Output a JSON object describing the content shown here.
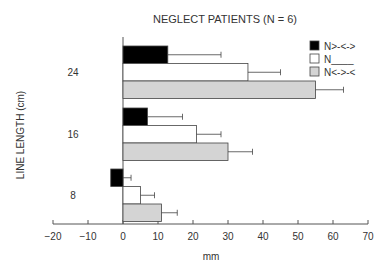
{
  "chart_data": {
    "type": "bar",
    "orientation": "horizontal",
    "title": "NEGLECT PATIENTS (N = 6)",
    "xlabel": "mm",
    "ylabel": "LINE LENGTH (cm)",
    "xlim": [
      -20,
      70
    ],
    "xticks": [
      -20,
      -10,
      0,
      10,
      20,
      30,
      40,
      50,
      60,
      70
    ],
    "categories": [
      "24",
      "16",
      "8"
    ],
    "grid": false,
    "legend_position": "upper right",
    "series": [
      {
        "name": "N>-<->",
        "color": "#000000",
        "values": [
          12.8,
          7.0,
          -3.5
        ],
        "errors": [
          15.2,
          10.0,
          5.8
        ]
      },
      {
        "name": "N____",
        "color": "#ffffff",
        "values": [
          35.7,
          21.0,
          5.0
        ],
        "errors": [
          9.3,
          7.0,
          4.0
        ]
      },
      {
        "name": "N<->-<",
        "color": "#d4d4d4",
        "values": [
          55.0,
          30.0,
          11.0
        ],
        "errors": [
          8.0,
          7.0,
          4.5
        ]
      }
    ]
  },
  "labels": {
    "title": "NEGLECT PATIENTS (N = 6)",
    "xlabel": "mm",
    "ylabel": "LINE LENGTH (cm)",
    "legend": [
      "N>-<->",
      "N____",
      "N<->-<"
    ]
  }
}
